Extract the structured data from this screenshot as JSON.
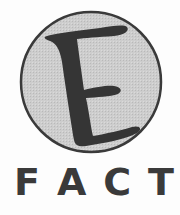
{
  "logo": {
    "emblem_letter": "E",
    "wordmark_letters": [
      "F",
      "A",
      "C",
      "T"
    ],
    "wordmark": "FACT"
  },
  "colors": {
    "background": "#fdfdfd",
    "circle_fill": "#c8c8c8",
    "circle_stroke": "#3a3a3a",
    "letter_fill": "#353535",
    "wordmark": "#3a3a3a"
  }
}
